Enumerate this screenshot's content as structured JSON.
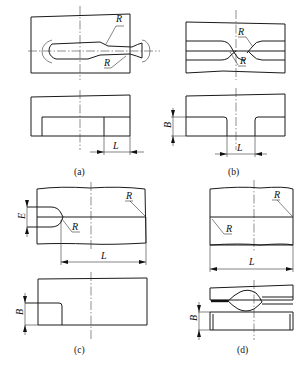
{
  "panels": [
    {
      "id": "a",
      "caption": "(a)",
      "top_view_labels": [
        "R",
        "R"
      ],
      "side_view_labels": [
        "L"
      ]
    },
    {
      "id": "b",
      "caption": "(b)",
      "top_view_labels": [
        "R",
        "R"
      ],
      "side_view_labels": [
        "B",
        "L"
      ]
    },
    {
      "id": "c",
      "caption": "(c)",
      "top_view_labels": [
        "E",
        "R",
        "R",
        "L"
      ],
      "side_view_labels": [
        "B"
      ]
    },
    {
      "id": "d",
      "caption": "(d)",
      "top_view_labels": [
        "R",
        "R",
        "L"
      ],
      "side_view_labels": [
        "B"
      ]
    }
  ]
}
